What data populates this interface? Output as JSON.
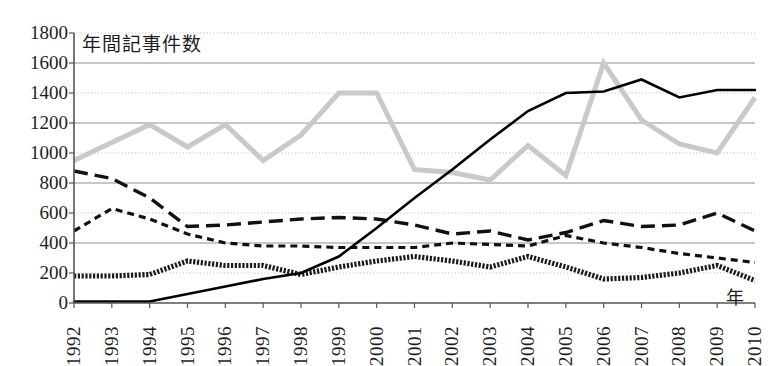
{
  "chart_data": {
    "type": "line",
    "title": "",
    "ylabel": "年間記事件数",
    "xlabel": "年",
    "ylim": [
      0,
      1800
    ],
    "ytick_step": 200,
    "yticks": [
      "1800",
      "1600",
      "1400",
      "1200",
      "1000",
      "800",
      "600",
      "400",
      "200",
      "0"
    ],
    "grid": true,
    "legend": "none",
    "categories": [
      "1992",
      "1993",
      "1994",
      "1995",
      "1996",
      "1997",
      "1998",
      "1999",
      "2000",
      "2001",
      "2002",
      "2003",
      "2004",
      "2005",
      "2006",
      "2007",
      "2008",
      "2009",
      "2010"
    ],
    "series": [
      {
        "name": "series-gray-thick",
        "style": "solid-thick-gray",
        "color": "#c9c9c9",
        "values": [
          950,
          1070,
          1190,
          1040,
          1190,
          950,
          1120,
          1400,
          1400,
          890,
          870,
          820,
          1050,
          850,
          1600,
          1220,
          1060,
          1000,
          1370
        ]
      },
      {
        "name": "series-long-dash",
        "style": "long-dash",
        "color": "#111111",
        "values": [
          880,
          830,
          700,
          510,
          520,
          540,
          560,
          570,
          560,
          520,
          460,
          480,
          420,
          470,
          550,
          510,
          520,
          600,
          480
        ]
      },
      {
        "name": "series-short-dash",
        "style": "short-dash",
        "color": "#111111",
        "values": [
          480,
          630,
          560,
          460,
          400,
          380,
          380,
          370,
          370,
          370,
          400,
          390,
          380,
          450,
          400,
          370,
          330,
          300,
          270
        ]
      },
      {
        "name": "series-dotted-thick",
        "style": "dotted-thick",
        "color": "#1a1a1a",
        "values": [
          180,
          180,
          190,
          280,
          250,
          250,
          190,
          240,
          280,
          310,
          280,
          240,
          310,
          240,
          160,
          170,
          200,
          250,
          150
        ]
      },
      {
        "name": "series-solid-thin",
        "style": "solid-thin",
        "color": "#000000",
        "values": [
          10,
          10,
          10,
          60,
          110,
          160,
          200,
          310,
          500,
          700,
          890,
          1090,
          1280,
          1400,
          1410,
          1490,
          1370,
          1420,
          1420
        ]
      }
    ]
  }
}
